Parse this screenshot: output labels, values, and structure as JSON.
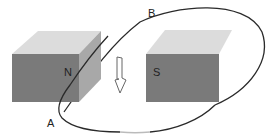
{
  "diagram": {
    "type": "physics-magnetic-induction",
    "magnets": [
      {
        "pole": "N",
        "position": "left"
      },
      {
        "pole": "S",
        "position": "right"
      }
    ],
    "loop_points": [
      {
        "label": "A",
        "position": "lower-left"
      },
      {
        "label": "B",
        "position": "top"
      }
    ],
    "arrow": {
      "direction": "down",
      "style": "hollow"
    },
    "colors": {
      "front_face": "#7a7a7a",
      "top_face": "#dcdcdc",
      "side_face": "#a8a8a8",
      "loop": "#2a2a2a"
    }
  }
}
